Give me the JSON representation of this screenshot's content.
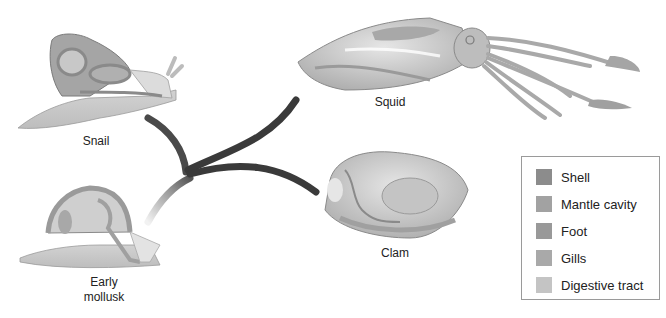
{
  "diagram": {
    "type": "phylogenetic-tree",
    "root": "Early mollusk",
    "branches": [
      "Snail",
      "Squid",
      "Clam"
    ]
  },
  "organisms": [
    {
      "id": "snail",
      "label": "Snail"
    },
    {
      "id": "squid",
      "label": "Squid"
    },
    {
      "id": "clam",
      "label": "Clam"
    },
    {
      "id": "early-mollusk",
      "label_line1": "Early",
      "label_line2": "mollusk"
    }
  ],
  "legend": {
    "items": [
      {
        "label": "Shell",
        "color": "#8c8c8c"
      },
      {
        "label": "Mantle cavity",
        "color": "#a2a2a2"
      },
      {
        "label": "Foot",
        "color": "#999999"
      },
      {
        "label": "Gills",
        "color": "#a9a9a9"
      },
      {
        "label": "Digestive tract",
        "color": "#c4c4c4"
      }
    ]
  },
  "colors": {
    "branch_dark": "#3a3a3a",
    "branch_light": "#dddddd",
    "body_light": "#d8d8d8",
    "body_mid": "#b8b8b8",
    "outline": "#7a7a7a"
  }
}
